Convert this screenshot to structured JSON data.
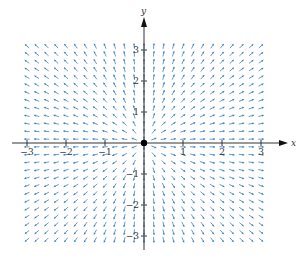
{
  "figure": {
    "field": {
      "fx": "x",
      "fy": "y",
      "normalized": true
    },
    "origin_marker": true
  },
  "axes": {
    "x": {
      "label": "x",
      "min": -3.3,
      "max": 3.6,
      "ticks": [
        -3,
        -2,
        -1,
        1,
        2,
        3
      ],
      "tick_labels": [
        "−3",
        "−2",
        "−1",
        "1",
        "2",
        "3"
      ]
    },
    "y": {
      "label": "y",
      "min": -3.5,
      "max": 4.0,
      "ticks": [
        -3,
        -2,
        -1,
        1,
        2,
        3
      ],
      "tick_labels": [
        "−3",
        "−2",
        "−1",
        "1",
        "2",
        "3"
      ]
    }
  },
  "grid": {
    "x_min": -3.0,
    "x_max": 3.0,
    "y_min": -3.125,
    "y_max": 3.125,
    "step": 0.25
  },
  "colors": {
    "arrow": "#3f7fc0",
    "axis": "#333333",
    "origin": "#000000"
  }
}
